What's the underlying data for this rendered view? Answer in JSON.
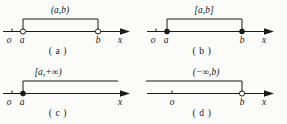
{
  "figure": {
    "background_color": "#fbfbfa",
    "ink_color": "#1b1b1f",
    "width": 287,
    "height": 124
  },
  "panels": [
    {
      "id": "a",
      "caption": "( a )",
      "interval_label": "(a,b)",
      "interval_type": "open",
      "left_endpoint_label": "a",
      "right_endpoint_label": "b",
      "origin_label": "o",
      "axis_label": "x",
      "left_marker": "open-circle",
      "right_marker": "open-circle",
      "bracket_left_x": 23,
      "bracket_right_x": 98
    },
    {
      "id": "b",
      "caption": "( b )",
      "interval_label": "[a,b]",
      "interval_type": "closed",
      "left_endpoint_label": "a",
      "right_endpoint_label": "b",
      "origin_label": "o",
      "axis_label": "x",
      "left_marker": "filled-dot",
      "right_marker": "filled-dot",
      "bracket_left_x": 23,
      "bracket_right_x": 98
    },
    {
      "id": "c",
      "caption": "( c )",
      "interval_label": "[a,+∞)",
      "interval_type": "half-open-right-infinite",
      "left_endpoint_label": "a",
      "right_endpoint_label": "",
      "origin_label": "o",
      "axis_label": "x",
      "left_marker": "filled-dot",
      "right_marker": "none",
      "bracket_left_x": 23,
      "bracket_right_x": 118
    },
    {
      "id": "d",
      "caption": "( d )",
      "interval_label": "(−∞,b)",
      "interval_type": "half-open-left-infinite",
      "left_endpoint_label": "",
      "right_endpoint_label": "b",
      "origin_label": "o",
      "axis_label": "x",
      "left_marker": "none",
      "right_marker": "open-circle",
      "bracket_left_x": 2,
      "bracket_right_x": 98
    }
  ]
}
